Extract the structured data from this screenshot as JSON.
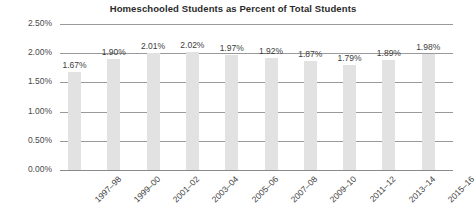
{
  "chart_data": {
    "type": "bar",
    "title": "Homeschooled Students as Percent of Total Students",
    "xlabel": "",
    "ylabel": "",
    "ylim": [
      0,
      2.5
    ],
    "yticks": [
      "0.00%",
      "0.50%",
      "1.00%",
      "1.50%",
      "2.00%",
      "2.50%"
    ],
    "ytick_values": [
      0,
      0.5,
      1.0,
      1.5,
      2.0,
      2.5
    ],
    "grid": true,
    "legend": "none",
    "bar_color": "#e2e2e2",
    "gridline_color": "#9a9a9a",
    "categories": [
      "1997–98",
      "1999–00",
      "2001–02",
      "2003–04",
      "2005–06",
      "2007–08",
      "2009–10",
      "2011–12",
      "2013–14",
      "2015–16"
    ],
    "values": [
      1.67,
      1.9,
      2.01,
      2.02,
      1.97,
      1.92,
      1.87,
      1.79,
      1.89,
      1.98
    ],
    "data_labels": [
      "1.67%",
      "1.90%",
      "2.01%",
      "2.02%",
      "1.97%",
      "1.92%",
      "1.87%",
      "1.79%",
      "1.89%",
      "1.98%"
    ]
  }
}
